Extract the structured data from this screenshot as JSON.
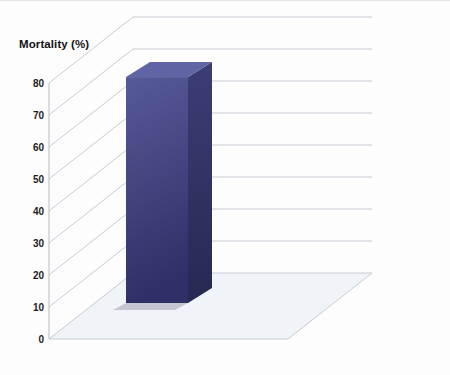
{
  "chart_data": {
    "type": "bar",
    "chart_style": "3d-column",
    "title": "Mortality (%)",
    "x_axis_title": "AR index",
    "categories": [
      "<25",
      "≥25"
    ],
    "series": [
      {
        "name": "none/mild periAR",
        "name_lines": [
          "none/mild",
          "periAR"
        ],
        "values": [
          33.3,
          15.4
        ],
        "bar_labels": [
          [
            "33.3",
            "(11/33)"
          ],
          [
            "15.4",
            "(14/91)"
          ]
        ],
        "colors": {
          "front_start": "#bfcde1",
          "front_end": "#7d95bb",
          "top": "#cbd7e8",
          "side_start": "#93a9c7",
          "side_end": "#6d85ac"
        }
      },
      {
        "name": "moderate/severe periAR",
        "name_lines": [
          "moderate/",
          "severe periAR"
        ],
        "values": [
          70.6,
          40.0
        ],
        "bar_labels": [
          [
            "70.6",
            "(12/17)"
          ],
          [
            "40.0",
            "(2/5)"
          ]
        ],
        "colors": {
          "front_start": "#575a99",
          "front_end": "#2e3066",
          "top": "#6064a4",
          "side_start": "#3b3e75",
          "side_end": "#262951"
        }
      }
    ],
    "y_ticks": [
      0,
      10,
      20,
      30,
      40,
      50,
      60,
      70,
      80
    ],
    "ylim": [
      0,
      80
    ],
    "grid": true,
    "legend_position": "right-of-plot-along-depth-axis",
    "style_colors": {
      "grid": "#c7ccd3",
      "axis": "#b6bbc4",
      "tick_text": "#1c1c1c",
      "bar_label_text": "#0d0d17",
      "category_text": "#141414",
      "series_label_text": "#232323",
      "floor_tint": "rgba(185,200,222,0.18)"
    }
  }
}
